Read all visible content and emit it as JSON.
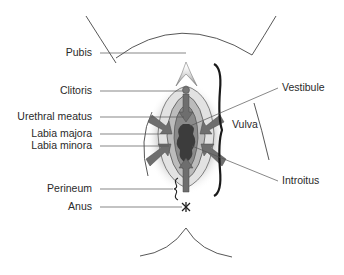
{
  "figure": {
    "type": "anatomical-diagram",
    "colors": {
      "line": "#444444",
      "arrow": "#6e6e6e",
      "arrow_dark": "#555555",
      "inner_fill": "#8a8a8a",
      "dark_fill": "#3c3c3c",
      "light_fill": "#d8d8d8",
      "brace": "#1a1a1a",
      "text": "#2a2a2a"
    }
  },
  "labels_left": [
    {
      "text": "Pubis",
      "x": 96,
      "y": 53
    },
    {
      "text": "Clitoris",
      "x": 96,
      "y": 91
    },
    {
      "text": "Urethral meatus",
      "x": 96,
      "y": 117
    },
    {
      "text": "Labia majora",
      "x": 96,
      "y": 134
    },
    {
      "text": "Labia minora",
      "x": 96,
      "y": 146
    },
    {
      "text": "Perineum",
      "x": 96,
      "y": 189
    },
    {
      "text": "Anus",
      "x": 96,
      "y": 207
    }
  ],
  "labels_right": [
    {
      "text": "Vestibule",
      "x": 282,
      "y": 88
    },
    {
      "text": "Vulva",
      "x": 232,
      "y": 125
    },
    {
      "text": "Introitus",
      "x": 282,
      "y": 181
    }
  ]
}
